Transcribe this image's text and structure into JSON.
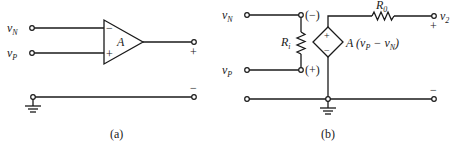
{
  "figure_a": {
    "caption": "(a)",
    "input_n": {
      "label": "v",
      "sub": "N"
    },
    "input_p": {
      "label": "v",
      "sub": "P"
    },
    "amp_gain": "A",
    "minus_input_sign": "−",
    "plus_input_sign": "+",
    "output_plus_sign": "+",
    "output_minus_sign": "−"
  },
  "figure_b": {
    "caption": "(b)",
    "input_n": {
      "label": "v",
      "sub": "N"
    },
    "input_p": {
      "label": "v",
      "sub": "P"
    },
    "node_minus": "(−)",
    "node_plus": "(+)",
    "input_resistor": {
      "label": "R",
      "sub": "i"
    },
    "output_resistor": {
      "label": "R",
      "sub": "0"
    },
    "source_plus": "+",
    "source_minus": "−",
    "source_expr": {
      "prefix": "A (v",
      "sub1": "P",
      "mid": " − v",
      "sub2": "N",
      "suffix": ")"
    },
    "output": {
      "label": "v",
      "sub": "2"
    },
    "output_plus_sign": "+",
    "output_minus_sign": "−"
  }
}
